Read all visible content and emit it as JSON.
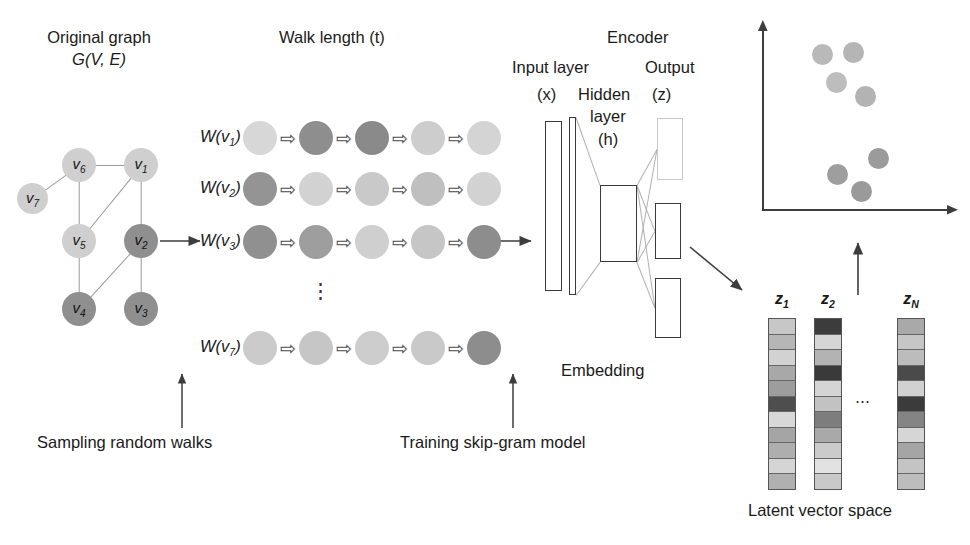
{
  "titles": {
    "original_graph_line1": "Original graph",
    "original_graph_line2": "G(V, E)",
    "walk_length": "Walk length (t)",
    "encoder": "Encoder",
    "input_layer": "Input layer",
    "input_symbol": "(x)",
    "hidden_line1": "Hidden",
    "hidden_line2": "layer",
    "hidden_symbol": "(h)",
    "output": "Output",
    "output_symbol": "(z)",
    "embedding": "Embedding",
    "sampling": "Sampling random walks",
    "training": "Training skip-gram model",
    "latent_space": "Latent vector space"
  },
  "graph": {
    "nodes": [
      {
        "id": "v1",
        "label": "v",
        "sub": "1",
        "x": 124,
        "y": 148,
        "d": 34,
        "color": "#cfcfcf"
      },
      {
        "id": "v2",
        "label": "v",
        "sub": "2",
        "x": 124,
        "y": 224,
        "d": 34,
        "color": "#8f8f8f"
      },
      {
        "id": "v3",
        "label": "v",
        "sub": "3",
        "x": 124,
        "y": 292,
        "d": 34,
        "color": "#8f8f8f"
      },
      {
        "id": "v4",
        "label": "v",
        "sub": "4",
        "x": 62,
        "y": 292,
        "d": 34,
        "color": "#8f8f8f"
      },
      {
        "id": "v5",
        "label": "v",
        "sub": "5",
        "x": 62,
        "y": 224,
        "d": 34,
        "color": "#cfcfcf"
      },
      {
        "id": "v6",
        "label": "v",
        "sub": "6",
        "x": 62,
        "y": 148,
        "d": 34,
        "color": "#cfcfcf"
      },
      {
        "id": "v7",
        "label": "v",
        "sub": "7",
        "x": 17,
        "y": 183,
        "d": 31,
        "color": "#cfcfcf"
      }
    ],
    "edges": [
      [
        "v6",
        "v1"
      ],
      [
        "v6",
        "v7"
      ],
      [
        "v6",
        "v5"
      ],
      [
        "v1",
        "v5"
      ],
      [
        "v1",
        "v2"
      ],
      [
        "v5",
        "v4"
      ],
      [
        "v2",
        "v4"
      ],
      [
        "v2",
        "v3"
      ]
    ]
  },
  "walks": {
    "arrow_glyph": "⇨",
    "dots": "⋮",
    "rows": [
      {
        "label": "W(v",
        "sub": "1",
        "close": ")",
        "y": 121,
        "colors": [
          "#d7d7d7",
          "#8e8e8e",
          "#8a8a8a",
          "#cdcdcd",
          "#d4d4d4"
        ]
      },
      {
        "label": "W(v",
        "sub": "2",
        "close": ")",
        "y": 172,
        "colors": [
          "#949494",
          "#d2d2d2",
          "#c9c9c9",
          "#bfbfbf",
          "#d2d2d2"
        ]
      },
      {
        "label": "W(v",
        "sub": "3",
        "close": ")",
        "y": 225,
        "colors": [
          "#909090",
          "#9e9e9e",
          "#cfcfcf",
          "#c6c6c6",
          "#8d8d8d"
        ]
      },
      {
        "label": "W(v",
        "sub": "7",
        "close": ")",
        "y": 331,
        "colors": [
          "#cbcbcb",
          "#c6c6c6",
          "#cdcdcd",
          "#c9c9c9",
          "#8d8d8d"
        ]
      }
    ]
  },
  "network": {
    "input_box": {
      "x": 545,
      "y": 121,
      "w": 17,
      "h": 170
    },
    "second_box": {
      "x": 569,
      "y": 117,
      "w": 7,
      "h": 178
    },
    "hidden_box": {
      "x": 600,
      "y": 185,
      "w": 37,
      "h": 77
    },
    "output_boxes": [
      {
        "x": 657,
        "y": 118,
        "w": 26,
        "h": 62,
        "faint": true
      },
      {
        "x": 655,
        "y": 203,
        "w": 26,
        "h": 56,
        "faint": false
      },
      {
        "x": 655,
        "y": 278,
        "w": 26,
        "h": 60,
        "faint": false
      }
    ]
  },
  "plot": {
    "points": [
      {
        "x": 812,
        "y": 44,
        "d": 21,
        "color": "#b9b9b9"
      },
      {
        "x": 843,
        "y": 42,
        "d": 21,
        "color": "#b5b5b5"
      },
      {
        "x": 826,
        "y": 72,
        "d": 21,
        "color": "#bdbdbd"
      },
      {
        "x": 855,
        "y": 86,
        "d": 21,
        "color": "#b3b3b3"
      },
      {
        "x": 868,
        "y": 148,
        "d": 21,
        "color": "#9b9b9b"
      },
      {
        "x": 827,
        "y": 164,
        "d": 21,
        "color": "#9e9e9e"
      },
      {
        "x": 851,
        "y": 181,
        "d": 21,
        "color": "#9a9a9a"
      }
    ]
  },
  "latent": {
    "ellipsis": "⋯",
    "vectors": [
      {
        "name": "z",
        "sub": "1",
        "x": 768,
        "y": 318,
        "w": 28,
        "h": 172,
        "cells": [
          "#c7c7c7",
          "#b6b6b6",
          "#d2d2d2",
          "#a8a8a8",
          "#9d9d9d",
          "#4e4e4e",
          "#d8d8d8",
          "#a5a5a5",
          "#aeaeae",
          "#d5d5d5",
          "#b0b0b0"
        ]
      },
      {
        "name": "z",
        "sub": "2",
        "x": 814,
        "y": 318,
        "w": 28,
        "h": 172,
        "cells": [
          "#3c3c3c",
          "#d6d6d6",
          "#b3b3b3",
          "#3a3a3a",
          "#d4d4d4",
          "#c2c2c2",
          "#7d7d7d",
          "#a9a9a9",
          "#cbcbcb",
          "#e2e2e2",
          "#c9c9c9"
        ]
      },
      {
        "name": "z",
        "sub": "N",
        "x": 897,
        "y": 318,
        "w": 28,
        "h": 172,
        "cells": [
          "#a9a9a9",
          "#c6c6c6",
          "#bcbcbc",
          "#4a4a4a",
          "#d1d1d1",
          "#3b3b3b",
          "#848484",
          "#d6d6d6",
          "#a5a5a5",
          "#c4c4c4",
          "#bdbdbd"
        ]
      }
    ]
  }
}
